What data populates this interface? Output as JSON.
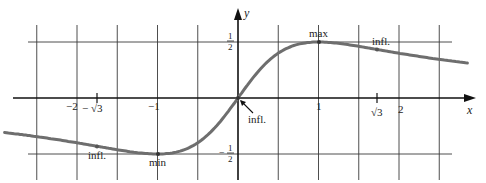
{
  "chart_data": {
    "type": "line",
    "function": "y = x / (x^2 + 1)",
    "title": "",
    "xlabel": "x",
    "ylabel": "y",
    "xlim": [
      -2.9,
      2.85
    ],
    "ylim": [
      -0.7,
      0.65
    ],
    "grid": true,
    "grid_step_x": 0.5,
    "grid_step_y": 0.5,
    "x_tick_labels": [
      {
        "x": -2,
        "label": "−2"
      },
      {
        "x": -1.732,
        "label": "−√3"
      },
      {
        "x": -1,
        "label": "−1"
      },
      {
        "x": 1,
        "label": "1"
      },
      {
        "x": 1.732,
        "label": "√3"
      },
      {
        "x": 2,
        "label": "2"
      }
    ],
    "y_tick_labels": [
      {
        "y": 0.5,
        "num": "1",
        "den": "2",
        "sign": ""
      },
      {
        "y": -0.5,
        "num": "1",
        "den": "2",
        "sign": "−"
      }
    ],
    "annotations": [
      {
        "label": "max",
        "x": 1,
        "y": 0.5
      },
      {
        "label": "min",
        "x": -1,
        "y": -0.5
      },
      {
        "label": "infl.",
        "x": 0,
        "y": 0
      },
      {
        "label": "infl.",
        "x": 1.732,
        "y": 0.433
      },
      {
        "label": "infl.",
        "x": -1.732,
        "y": -0.433
      }
    ],
    "series": [
      {
        "name": "f(x)",
        "color": "#6e6e6e",
        "x": [
          -2.8,
          -2.5,
          -2,
          -1.732,
          -1.5,
          -1.25,
          -1,
          -0.75,
          -0.5,
          -0.25,
          0,
          0.25,
          0.5,
          0.75,
          1,
          1.25,
          1.5,
          1.732,
          2,
          2.5,
          2.85
        ],
        "values": [
          -0.316,
          -0.345,
          -0.4,
          -0.433,
          -0.462,
          -0.488,
          -0.5,
          -0.48,
          -0.4,
          -0.235,
          0,
          0.235,
          0.4,
          0.48,
          0.5,
          0.488,
          0.462,
          0.433,
          0.4,
          0.345,
          0.312
        ]
      }
    ]
  },
  "labels": {
    "x_axis": "x",
    "y_axis": "y",
    "max": "max",
    "min": "min",
    "infl_origin": "infl.",
    "infl_right": "infl.",
    "infl_left": "infl.",
    "tick_neg2": "−2",
    "tick_neg_sqrt3_sign": "−",
    "tick_neg_sqrt3": "√3",
    "tick_neg1": "−1",
    "tick_1": "1",
    "tick_sqrt3": "√3",
    "tick_2": "2",
    "half_num": "1",
    "half_den": "2",
    "neg_half_sign": "−",
    "neg_half_num": "1",
    "neg_half_den": "2"
  },
  "colors": {
    "curve": "#6b6b6b",
    "axis": "#111111",
    "grid": "#3a3a3a"
  }
}
